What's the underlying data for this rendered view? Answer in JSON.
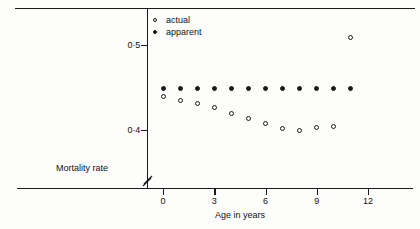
{
  "chart_data": {
    "type": "scatter",
    "title": "",
    "xlabel": "Age in years",
    "ylabel": "Mortality rate",
    "xlim": [
      -1,
      13
    ],
    "ylim": [
      0.385,
      0.512
    ],
    "grid": false,
    "axis_break": true,
    "legend_position": "top-left",
    "xticks": [
      0,
      3,
      6,
      9,
      12
    ],
    "xtick_labels": [
      "0",
      "3",
      "6",
      "9",
      "12"
    ],
    "yticks": [
      0.5,
      0.4
    ],
    "ytick_labels": [
      "0·5",
      "0·4"
    ],
    "x": [
      0,
      1,
      2,
      3,
      4,
      5,
      6,
      7,
      8,
      9,
      10,
      11
    ],
    "series": [
      {
        "name": "actual",
        "marker": "open-circle",
        "values": [
          0.439,
          0.435,
          0.431,
          0.427,
          0.42,
          0.414,
          0.408,
          0.402,
          0.399,
          0.403,
          0.404,
          0.509
        ]
      },
      {
        "name": "apparent",
        "marker": "filled-circle",
        "values": [
          0.449,
          0.449,
          0.449,
          0.449,
          0.449,
          0.449,
          0.449,
          0.449,
          0.449,
          0.449,
          0.449,
          0.449
        ]
      }
    ]
  },
  "legend": {
    "items": [
      {
        "label": "actual",
        "marker": "open-circle"
      },
      {
        "label": "apparent",
        "marker": "filled-circle"
      }
    ]
  },
  "axes": {
    "x_title": "Age in years",
    "y_title": "Mortality rate",
    "x_tick_labels": [
      "0",
      "3",
      "6",
      "9",
      "12"
    ],
    "y_tick_labels": [
      "0·5",
      "0·4"
    ]
  },
  "colors": {
    "ink": "#1a1a1a",
    "background": "#fdfdfb"
  }
}
